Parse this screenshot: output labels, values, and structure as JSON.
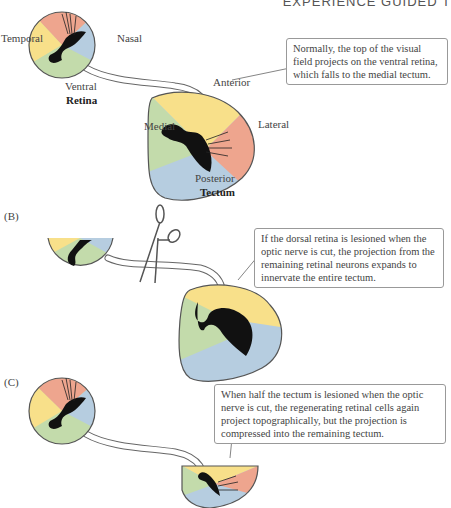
{
  "header": {
    "running_title": "EXPERIENCE GUIDED T"
  },
  "colors": {
    "red": "#eea58e",
    "blue": "#b6cde0",
    "green": "#c3dbab",
    "yellow": "#f8e08a",
    "silhouette": "#111111",
    "outline": "#555555"
  },
  "panel_a": {
    "retina_labels": {
      "temporal": "Temporal",
      "nasal": "Nasal",
      "ventral": "Ventral",
      "title": "Retina"
    },
    "tectum_labels": {
      "anterior": "Anterior",
      "medial": "Medial",
      "lateral": "Lateral",
      "posterior": "Posterior",
      "title": "Tectum"
    },
    "callout": "Normally, the top of the visual field projects on the ventral retina, which falls to the medial tectum."
  },
  "panel_b": {
    "label": "(B)",
    "callout": "If the dorsal retina is lesioned when the optic nerve is cut, the projection from the remaining retinal neurons expands to innervate the entire tectum."
  },
  "panel_c": {
    "label": "(C)",
    "callout": "When half the tectum is lesioned when the optic nerve is cut, the regenerating retinal cells again project topographically, but the projection is compressed into the remaining tectum."
  }
}
